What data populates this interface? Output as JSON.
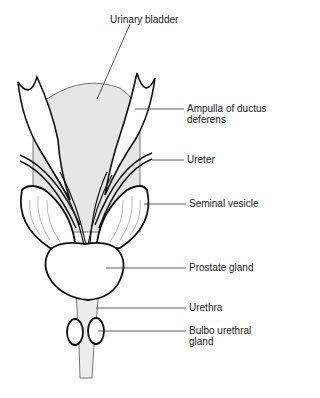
{
  "diagram": {
    "colors": {
      "stroke": "#111111",
      "bladder_fill": "#e6e6e6",
      "leader": "#333333",
      "background": "#ffffff"
    },
    "labels": [
      {
        "id": "urinary-bladder",
        "text": "Urinary bladder"
      },
      {
        "id": "ampulla",
        "text": "Ampulla of ductus",
        "text2": "deferens"
      },
      {
        "id": "ureter",
        "text": "Ureter"
      },
      {
        "id": "seminal-vesicle",
        "text": "Seminal vesicle"
      },
      {
        "id": "prostate-gland",
        "text": "Prostate gland"
      },
      {
        "id": "urethra",
        "text": "Urethra"
      },
      {
        "id": "bulbo-urethral-gland",
        "text": "Bulbo urethral",
        "text2": "gland"
      }
    ]
  }
}
